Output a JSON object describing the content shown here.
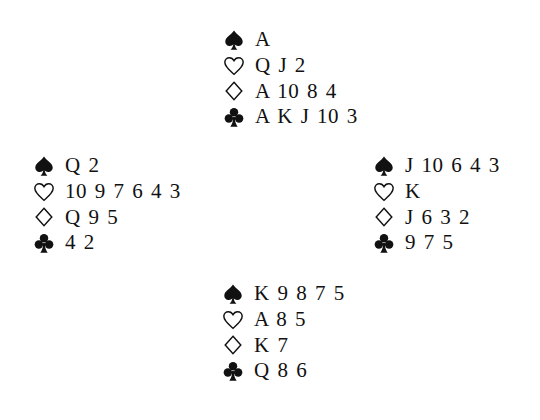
{
  "deal": {
    "north": {
      "spades": "A",
      "hearts": "Q J 2",
      "diamonds": "A 10 8 4",
      "clubs": "A K J 10 3"
    },
    "west": {
      "spades": "Q 2",
      "hearts": "10 9 7 6 4 3",
      "diamonds": "Q 9 5",
      "clubs": "4 2"
    },
    "east": {
      "spades": "J 10 6 4 3",
      "hearts": "K",
      "diamonds": "J 6 3 2",
      "clubs": "9 7 5"
    },
    "south": {
      "spades": "K 9 8 7 5",
      "hearts": "A 8 5",
      "diamonds": "K 7",
      "clubs": "Q 8 6"
    }
  },
  "icons": {
    "spades": "spade-icon (filled)",
    "hearts": "heart-icon (outline)",
    "diamonds": "diamond-icon (outline)",
    "clubs": "club-icon (filled)"
  },
  "colors": {
    "ink": "#111111",
    "background": "#ffffff"
  }
}
